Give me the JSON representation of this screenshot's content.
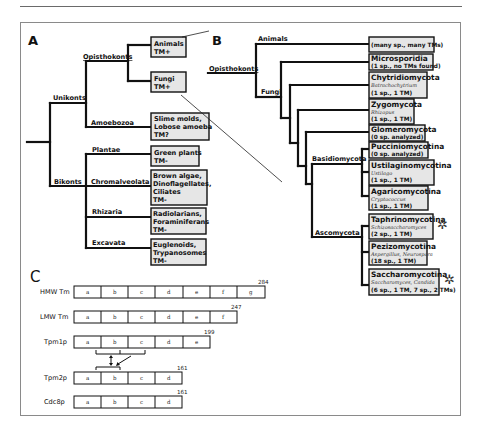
{
  "panels": {
    "a": {
      "label": "A",
      "clades": {
        "unikonts": "Unikonts",
        "opisthokonts": "Opisthokonts",
        "amoebozoa": "Amoebozoa",
        "bikonts": "Bikonts",
        "plantae": "Plantae",
        "chromalveolata": "Chromalveolata",
        "rhizaria": "Rhizaria",
        "excavata": "Excavata"
      },
      "boxes": [
        {
          "id": "animals",
          "lines": [
            "Animals",
            "TM+"
          ]
        },
        {
          "id": "fungi",
          "lines": [
            "Fungi",
            "TM+"
          ]
        },
        {
          "id": "slime-molds",
          "lines": [
            "Slime molds,",
            "Lobose amoeba",
            "TM?"
          ]
        },
        {
          "id": "green-plants",
          "lines": [
            "Green plants",
            "TM-"
          ]
        },
        {
          "id": "brown-algae",
          "lines": [
            "Brown algae,",
            "Dinoflagellates,",
            "Ciliates",
            "TM-"
          ]
        },
        {
          "id": "radiolarians",
          "lines": [
            "Radiolarians,",
            "Foraminiferans",
            "TM-"
          ]
        },
        {
          "id": "euglenoids",
          "lines": [
            "Euglenoids,",
            "Trypanosomes",
            "TM-"
          ]
        }
      ]
    },
    "b": {
      "label": "B",
      "clades": {
        "animals": "Animals",
        "opisthokonts": "Opisthokonts",
        "fungi": "Fungi",
        "basidiomycota": "Basidiomycota",
        "ascomycota": "Ascomycota"
      },
      "boxes": [
        {
          "id": "animals",
          "title": "",
          "genus": "",
          "count": "(many sp., many TMs)"
        },
        {
          "id": "microsporidia",
          "title": "Microsporidia",
          "genus": "",
          "count": "(1 sp., no TMs found)"
        },
        {
          "id": "chytridiomycota",
          "title": "Chytridiomycota",
          "genus": "Batrachochytrium",
          "count": "(1 sp., 1 TM)"
        },
        {
          "id": "zygomycota",
          "title": "Zygomycota",
          "genus": "Rhizopus",
          "count": "(1 sp., 1 TM)"
        },
        {
          "id": "glomeromycota",
          "title": "Glomeromycota",
          "genus": "",
          "count": "(0 sp. analyzed)"
        },
        {
          "id": "pucciniomycotina",
          "title": "Pucciniomycotina",
          "genus": "",
          "count": "(0 sp. analyzed)"
        },
        {
          "id": "ustilaginomycotina",
          "title": "Ustilaginomycotina",
          "genus": "Ustilago",
          "count": "(1 sp., 1 TM)"
        },
        {
          "id": "agaricomycotina",
          "title": "Agaricomycotina",
          "genus": "Cryptococcus",
          "count": "(1 sp., 1 TM)"
        },
        {
          "id": "taphrinomycotina",
          "title": "Taphrinomycotina",
          "genus": "Schizosaccharomyces",
          "count": "(2 sp., 1 TM)",
          "marked": true
        },
        {
          "id": "pezizomycotina",
          "title": "Pezizomycotina",
          "genus": "Aspergillus, Neurospora",
          "count": "(18 sp., 1 TM)"
        },
        {
          "id": "saccharomycotina",
          "title": "Saccharomycotina",
          "genus": "Saccharomyces, Candida",
          "count": "(6 sp., 1 TM, 7 sp., 2 TMs)",
          "marked": true
        }
      ],
      "marker": "✲"
    },
    "c": {
      "label": "C",
      "rows": [
        {
          "name": "HMW Tm",
          "segments": [
            "a",
            "b",
            "c",
            "d",
            "e",
            "f",
            "g"
          ],
          "length": "284"
        },
        {
          "name": "LMW Tm",
          "segments": [
            "a",
            "b",
            "c",
            "d",
            "e",
            "f"
          ],
          "length": "247"
        },
        {
          "name": "Tpm1p",
          "segments": [
            "a",
            "b",
            "c",
            "d",
            "e"
          ],
          "length": "199"
        },
        {
          "name": "Tpm2p",
          "segments": [
            "a",
            "b",
            "c",
            "d"
          ],
          "length": "161"
        },
        {
          "name": "Cdc8p",
          "segments": [
            "a",
            "b",
            "c",
            "d"
          ],
          "length": "161"
        }
      ]
    }
  }
}
